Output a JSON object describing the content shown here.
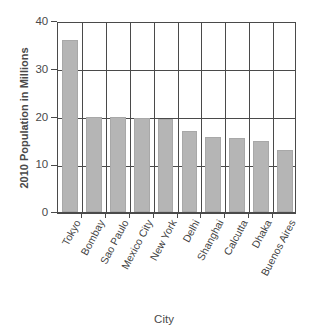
{
  "chart_data": {
    "type": "bar",
    "title": "",
    "xlabel": "City",
    "ylabel": "2010 Population in Millions",
    "categories": [
      "Tokyo",
      "Bombay",
      "Sao Paulo",
      "Mexico City",
      "New York",
      "Delhi",
      "Shanghai",
      "Calcutta",
      "Dhaka",
      "Buenos Aires"
    ],
    "values": [
      36.0,
      20.0,
      19.8,
      19.7,
      19.5,
      17.0,
      15.8,
      15.5,
      14.8,
      13.0
    ],
    "ylim": [
      0,
      40
    ],
    "yticks": [
      0,
      10,
      20,
      30,
      40
    ],
    "ytick_labels": [
      "0",
      "10",
      "20",
      "30",
      "40"
    ],
    "grid": "horizontal-and-vertical",
    "legend": "none",
    "bar_color": "#b5b5b5",
    "axis_color": "#4a4a4a",
    "background": "#ffffff"
  }
}
